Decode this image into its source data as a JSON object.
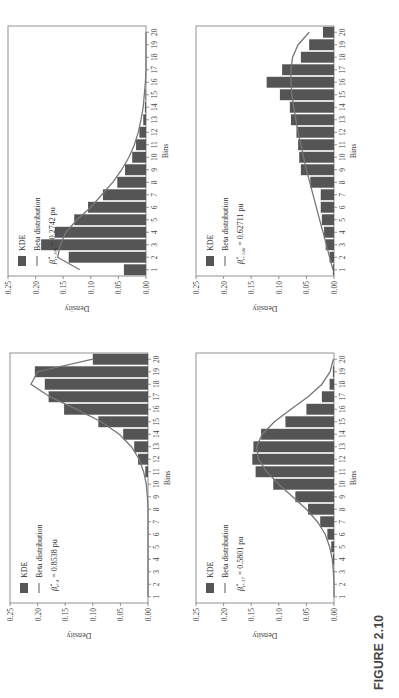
{
  "figure": {
    "caption": "FIGURE 2.10",
    "bar_color": "#555555",
    "line_color": "#777777"
  },
  "chart_data": [
    {
      "id": "t4",
      "type": "bar",
      "position": "bottom-left",
      "title": "",
      "xlabel": "Bins",
      "ylabel": "Density",
      "ylim": [
        0,
        0.25
      ],
      "yticks": [
        "0.00",
        "0.05",
        "0.10",
        "0.15",
        "0.20",
        "0.25"
      ],
      "categories": [
        "1",
        "2",
        "3",
        "4",
        "5",
        "6",
        "7",
        "8",
        "9",
        "10",
        "11",
        "12",
        "13",
        "14",
        "15",
        "16",
        "17",
        "18",
        "19",
        "20"
      ],
      "series": [
        {
          "name": "KDE",
          "type": "bar",
          "values": [
            0,
            0,
            0,
            0,
            0,
            0,
            0,
            0,
            0,
            0,
            0.005,
            0.018,
            0.025,
            0.045,
            0.09,
            0.152,
            0.18,
            0.187,
            0.205,
            0.1
          ]
        },
        {
          "name": "Beta distribution",
          "type": "line",
          "values": [
            0,
            0,
            0,
            0,
            0,
            0,
            0,
            0,
            0.001,
            0.003,
            0.008,
            0.016,
            0.03,
            0.052,
            0.085,
            0.13,
            0.178,
            0.212,
            0.2,
            0.1
          ]
        }
      ],
      "legend": {
        "kde": "KDE",
        "beta": "Beta distribution",
        "param_symbol": "β̂",
        "param_subscript": "t+4",
        "param_value": "= 0.8538 pu"
      }
    },
    {
      "id": "t37",
      "type": "bar",
      "position": "bottom-right",
      "title": "",
      "xlabel": "Bins",
      "ylabel": "Density",
      "ylim": [
        0,
        0.25
      ],
      "yticks": [
        "0.00",
        "0.05",
        "0.10",
        "0.15",
        "0.20",
        "0.25"
      ],
      "categories": [
        "1",
        "2",
        "3",
        "4",
        "5",
        "6",
        "7",
        "8",
        "9",
        "10",
        "11",
        "12",
        "13",
        "14",
        "15",
        "16",
        "17",
        "18",
        "19",
        "20"
      ],
      "series": [
        {
          "name": "KDE",
          "type": "bar",
          "values": [
            0,
            0,
            0,
            0.002,
            0.005,
            0.012,
            0.025,
            0.047,
            0.07,
            0.11,
            0.142,
            0.148,
            0.146,
            0.132,
            0.088,
            0.05,
            0.022,
            0.008,
            0.002,
            0
          ]
        },
        {
          "name": "Beta distribution",
          "type": "line",
          "values": [
            0,
            0,
            0.001,
            0.003,
            0.008,
            0.016,
            0.03,
            0.05,
            0.075,
            0.1,
            0.122,
            0.137,
            0.14,
            0.13,
            0.108,
            0.078,
            0.047,
            0.022,
            0.007,
            0.001
          ]
        }
      ],
      "legend": {
        "kde": "KDE",
        "beta": "Beta distribution",
        "param_symbol": "β̂",
        "param_subscript": "t+37",
        "param_value": "= 0.5801 pu"
      }
    },
    {
      "id": "t106",
      "type": "bar",
      "position": "top-left",
      "title": "",
      "xlabel": "Bins",
      "ylabel": "Density",
      "ylim": [
        0,
        0.25
      ],
      "yticks": [
        "0.00",
        "0.05",
        "0.10",
        "0.15",
        "0.20",
        "0.25"
      ],
      "categories": [
        "1",
        "2",
        "3",
        "4",
        "5",
        "6",
        "7",
        "8",
        "9",
        "10",
        "11",
        "12",
        "13",
        "14",
        "15",
        "16",
        "17",
        "18",
        "19",
        "20"
      ],
      "series": [
        {
          "name": "KDE",
          "type": "bar",
          "values": [
            0.04,
            0.14,
            0.19,
            0.165,
            0.13,
            0.105,
            0.078,
            0.052,
            0.038,
            0.025,
            0.018,
            0.012,
            0.005,
            0.002,
            0.001,
            0,
            0,
            0,
            0,
            0
          ]
        },
        {
          "name": "Beta distribution",
          "type": "line",
          "values": [
            0.12,
            0.16,
            0.155,
            0.145,
            0.125,
            0.1,
            0.08,
            0.06,
            0.044,
            0.031,
            0.021,
            0.014,
            0.009,
            0.005,
            0.003,
            0.001,
            0,
            0,
            0,
            0
          ]
        }
      ],
      "legend": {
        "kde": "KDE",
        "beta": "Beta distribution",
        "param_symbol": "β̂",
        "param_subscript": "t+106",
        "param_value": "= 0.2742 pu"
      }
    },
    {
      "id": "t146",
      "type": "bar",
      "position": "top-right",
      "title": "",
      "xlabel": "Bins",
      "ylabel": "Density",
      "ylim": [
        0,
        0.25
      ],
      "yticks": [
        "0.00",
        "0.05",
        "0.10",
        "0.15",
        "0.20",
        "0.25"
      ],
      "categories": [
        "1",
        "2",
        "3",
        "4",
        "5",
        "6",
        "7",
        "8",
        "9",
        "10",
        "11",
        "12",
        "13",
        "14",
        "15",
        "16",
        "17",
        "18",
        "19",
        "20"
      ],
      "series": [
        {
          "name": "KDE",
          "type": "bar",
          "values": [
            0.002,
            0.008,
            0.015,
            0.018,
            0.022,
            0.024,
            0.024,
            0.043,
            0.06,
            0.063,
            0.065,
            0.068,
            0.078,
            0.08,
            0.098,
            0.122,
            0.094,
            0.06,
            0.045,
            0.02
          ]
        },
        {
          "name": "Beta distribution",
          "type": "line",
          "values": [
            0.002,
            0.008,
            0.014,
            0.02,
            0.026,
            0.032,
            0.038,
            0.044,
            0.05,
            0.055,
            0.06,
            0.065,
            0.069,
            0.073,
            0.076,
            0.078,
            0.078,
            0.075,
            0.065,
            0.045
          ]
        }
      ],
      "legend": {
        "kde": "KDE",
        "beta": "Beta distribution",
        "param_symbol": "β̂",
        "param_subscript": "t+146",
        "param_value": "= 0.62711 pu"
      }
    }
  ]
}
